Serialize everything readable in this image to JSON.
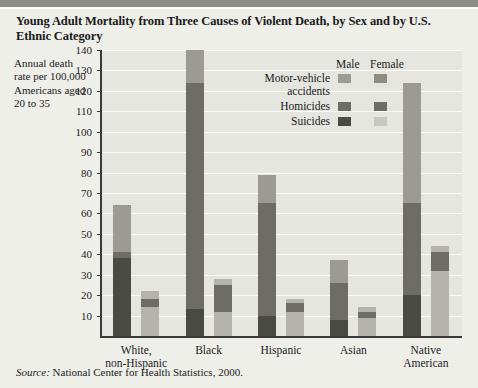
{
  "title": "Young Adult Mortality from Three Causes of Violent Death, by Sex and by U.S. Ethnic Category",
  "axis_caption": "Annual death rate per 100,000 Americans aged 20 to 35",
  "source_prefix": "Source:",
  "source_text": "National Center for Health Statistics, 2000.",
  "legend": {
    "male_header": "Male",
    "female_header": "Female",
    "rows": [
      {
        "label_line1": "Motor-vehicle",
        "label_line2": "accidents",
        "male_color": "#9b9b93",
        "female_color": "#8c8c84"
      },
      {
        "label_line1": "Homicides",
        "label_line2": "",
        "male_color": "#6d6d66",
        "female_color": "#6d6d66"
      },
      {
        "label_line1": "Suicides",
        "label_line2": "",
        "male_color": "#4a4a45",
        "female_color": "#c8c8c0"
      }
    ]
  },
  "colors": {
    "motor_vehicle_male": "#9b9b93",
    "motor_vehicle_female": "#b4b4ac",
    "homicides": "#6d6d66",
    "suicides_male": "#4a4a45",
    "plot_bg": "#e6e6e1",
    "page_bg": "#efefea",
    "axis": "#3a3a38",
    "grid": "#fbfbf8"
  },
  "chart_data": {
    "type": "bar",
    "subtype": "grouped-stacked",
    "title": "Young Adult Mortality from Three Causes of Violent Death, by Sex and by U.S. Ethnic Category",
    "xlabel": "",
    "ylabel": "Annual death rate per 100,000 Americans aged 20 to 35",
    "ylim": [
      0,
      140
    ],
    "ytick_step": 10,
    "yticks": [
      10,
      20,
      30,
      40,
      50,
      60,
      70,
      80,
      90,
      100,
      110,
      120,
      130,
      140
    ],
    "grid": true,
    "legend_position": "inside-top-center",
    "categories": [
      "White, non-Hispanic",
      "Black",
      "Hispanic",
      "Asian",
      "Native American"
    ],
    "category_lines": [
      [
        "White,",
        "non-Hispanic"
      ],
      [
        "Black",
        ""
      ],
      [
        "Hispanic",
        ""
      ],
      [
        "Asian",
        ""
      ],
      [
        "Native",
        "American"
      ]
    ],
    "stack_order_bottom_to_top": [
      "Suicides",
      "Homicides",
      "Motor-vehicle accidents"
    ],
    "series": [
      {
        "name": "Male",
        "stacks": [
          {
            "category": "White, non-Hispanic",
            "Suicides": 38,
            "Homicides": 3,
            "Motor-vehicle accidents": 23,
            "total": 64
          },
          {
            "category": "Black",
            "Suicides": 13,
            "Homicides": 111,
            "Motor-vehicle accidents": 16,
            "total": 140
          },
          {
            "category": "Hispanic",
            "Suicides": 10,
            "Homicides": 55,
            "Motor-vehicle accidents": 14,
            "total": 79
          },
          {
            "category": "Asian",
            "Suicides": 8,
            "Homicides": 18,
            "Motor-vehicle accidents": 11,
            "total": 37
          },
          {
            "category": "Native American",
            "Suicides": 20,
            "Homicides": 45,
            "Motor-vehicle accidents": 59,
            "total": 124
          }
        ]
      },
      {
        "name": "Female",
        "stacks": [
          {
            "category": "White, non-Hispanic",
            "Suicides": 14,
            "Homicides": 4,
            "Motor-vehicle accidents": 4,
            "total": 22
          },
          {
            "category": "Black",
            "Suicides": 12,
            "Homicides": 13,
            "Motor-vehicle accidents": 3,
            "total": 28
          },
          {
            "category": "Hispanic",
            "Suicides": 12,
            "Homicides": 4,
            "Motor-vehicle accidents": 2,
            "total": 18
          },
          {
            "category": "Asian",
            "Suicides": 9,
            "Homicides": 3,
            "Motor-vehicle accidents": 2,
            "total": 14
          },
          {
            "category": "Native American",
            "Suicides": 32,
            "Homicides": 9,
            "Motor-vehicle accidents": 3,
            "total": 44
          }
        ]
      }
    ]
  }
}
